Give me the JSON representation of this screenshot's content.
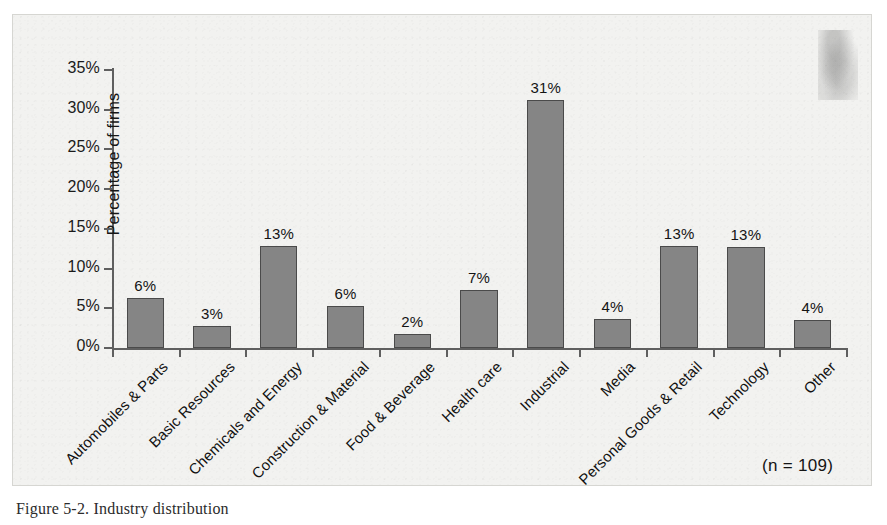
{
  "caption": "Figure 5-2. Industry distribution",
  "annotation": "(n = 109)",
  "colors": {
    "bar_fill": "#858585",
    "bar_stroke": "#4a4a4a",
    "axis": "#5f5f5f",
    "plot_background": "#f2f2f0",
    "text": "#141414"
  },
  "chart_data": {
    "type": "bar",
    "title": "",
    "xlabel": "",
    "ylabel": "Percentage of firms",
    "ylim": [
      0,
      35
    ],
    "ytick_labels": [
      "0%",
      "5%",
      "10%",
      "15%",
      "20%",
      "25%",
      "30%",
      "35%"
    ],
    "ytick_values": [
      0,
      5,
      10,
      15,
      20,
      25,
      30,
      35
    ],
    "grid": false,
    "legend": "none",
    "annotation": "(n = 109)",
    "categories": [
      "Automobiles & Parts",
      "Basic Resources",
      "Chemicals and Energy",
      "Construction & Material",
      "Food & Beverage",
      "Health care",
      "Industrial",
      "Media",
      "Personal Goods & Retail",
      "Technology",
      "Other"
    ],
    "values": [
      6.3,
      2.8,
      12.8,
      5.3,
      1.8,
      7.3,
      31.2,
      3.6,
      12.8,
      12.7,
      3.5
    ],
    "data_labels": [
      "6%",
      "3%",
      "13%",
      "6%",
      "2%",
      "7%",
      "31%",
      "4%",
      "13%",
      "13%",
      "4%"
    ]
  }
}
